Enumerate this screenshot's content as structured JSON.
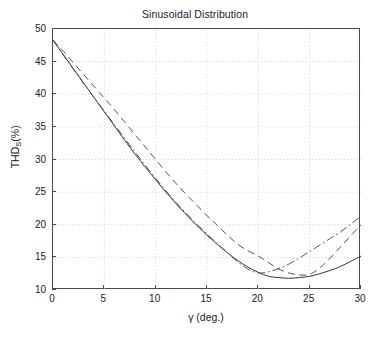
{
  "chart_data": {
    "type": "line",
    "title": "Sinusoidal Distribution",
    "xlabel": "γ (deg.)",
    "ylabel_main": "THD",
    "ylabel_sub": "S",
    "ylabel_unit": "(%)",
    "xlim": [
      0,
      30
    ],
    "ylim": [
      10,
      50
    ],
    "xticks": [
      0,
      5,
      10,
      15,
      20,
      25,
      30
    ],
    "yticks": [
      10,
      15,
      20,
      25,
      30,
      35,
      40,
      45,
      50
    ],
    "xtick_labels": [
      "0",
      "5",
      "10",
      "15",
      "20",
      "25",
      "30"
    ],
    "ytick_labels": [
      "10",
      "15",
      "20",
      "25",
      "30",
      "35",
      "40",
      "45",
      "50"
    ],
    "grid": true,
    "grid_style": "dotted",
    "grid_color": "#c8c8c8",
    "legend": "none",
    "axis_color": "#4a4a4a",
    "background": "#ffffff",
    "series": [
      {
        "name": "solid-curve",
        "style": "solid",
        "color": "#2b2b2b",
        "x": [
          0,
          1,
          2,
          3,
          4,
          5,
          6,
          7,
          8,
          9,
          10,
          11,
          12,
          13,
          14,
          15,
          16,
          17,
          18,
          19,
          20,
          21,
          22,
          23,
          24,
          25,
          26,
          27,
          28,
          29,
          30
        ],
        "y": [
          48.3,
          46.1,
          43.9,
          41.7,
          39.5,
          37.3,
          35.1,
          32.9,
          30.8,
          28.8,
          26.9,
          25.0,
          23.2,
          21.5,
          19.9,
          18.4,
          17.0,
          15.7,
          14.5,
          13.5,
          12.7,
          12.1,
          11.9,
          11.8,
          11.9,
          12.1,
          12.5,
          13.0,
          13.6,
          14.4,
          15.2
        ]
      },
      {
        "name": "dashed-curve",
        "style": "dashed",
        "color": "#4a4a4a",
        "x": [
          0,
          1,
          2,
          3,
          4,
          5,
          6,
          7,
          8,
          9,
          10,
          11,
          12,
          13,
          14,
          15,
          16,
          17,
          18,
          19,
          20,
          21,
          22,
          23,
          24,
          25,
          26,
          27,
          28,
          29,
          30
        ],
        "y": [
          48.3,
          46.6,
          44.8,
          43.0,
          41.2,
          39.4,
          37.6,
          35.7,
          33.8,
          31.9,
          30.0,
          28.1,
          26.3,
          24.6,
          23.0,
          21.4,
          19.9,
          18.4,
          17.0,
          16.0,
          15.2,
          14.2,
          13.2,
          12.6,
          12.3,
          12.4,
          13.4,
          14.9,
          16.6,
          18.3,
          20.0
        ]
      },
      {
        "name": "dash-dot-curve",
        "style": "dashdot",
        "color": "#4a4a4a",
        "x": [
          0,
          1,
          2,
          3,
          4,
          5,
          6,
          7,
          8,
          9,
          10,
          11,
          12,
          13,
          14,
          15,
          16,
          17,
          18,
          19,
          20,
          21,
          22,
          23,
          24,
          25,
          26,
          27,
          28,
          29,
          30
        ],
        "y": [
          48.3,
          46.0,
          43.8,
          41.6,
          39.5,
          37.4,
          35.3,
          33.2,
          31.1,
          29.1,
          27.1,
          25.2,
          23.4,
          21.7,
          20.1,
          18.6,
          17.1,
          15.7,
          14.3,
          13.2,
          12.6,
          12.8,
          13.3,
          14.0,
          14.9,
          15.9,
          16.9,
          17.9,
          18.9,
          20.1,
          21.3
        ]
      }
    ]
  }
}
